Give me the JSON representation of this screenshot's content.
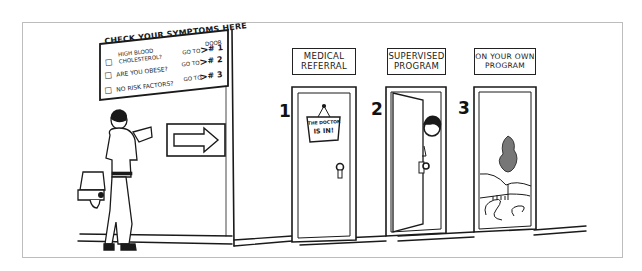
{
  "illustration": {
    "title": "Health screening door choice",
    "colors": {
      "ink": "#1a1a1a",
      "paper": "#ffffff",
      "frame": "#bdbdbd"
    }
  },
  "symptom_board": {
    "title": "CHECK YOUR SYMPTOMS HERE",
    "column_header": "DOOR",
    "rows": [
      {
        "checkbox": "□",
        "label_line1": "HIGH BLOOD",
        "label_line2": "CHOLESTEROL?",
        "goto": "GO TO",
        "door": "# 1"
      },
      {
        "checkbox": "□",
        "label_line1": "ARE YOU OBESE?",
        "label_line2": "",
        "goto": "GO TO",
        "door": "# 2"
      },
      {
        "checkbox": "□",
        "label_line1": "NO RISK FACTORS?",
        "label_line2": "",
        "goto": "GO TO",
        "door": "# 3"
      }
    ]
  },
  "arrow_sign": {
    "icon": "arrow-right-icon"
  },
  "doors": [
    {
      "number": "1",
      "sign_line1": "MEDICAL",
      "sign_line2": "REFERRAL",
      "state": "closed",
      "hanging_sign_line1": "THE DOCTOR",
      "hanging_sign_line2": "IS IN!"
    },
    {
      "number": "2",
      "sign_line1": "SUPERVISED",
      "sign_line2": "PROGRAM",
      "state": "ajar"
    },
    {
      "number": "3",
      "sign_line1": "ON YOUR OWN",
      "sign_line2": "PROGRAM",
      "state": "open-landscape"
    }
  ]
}
